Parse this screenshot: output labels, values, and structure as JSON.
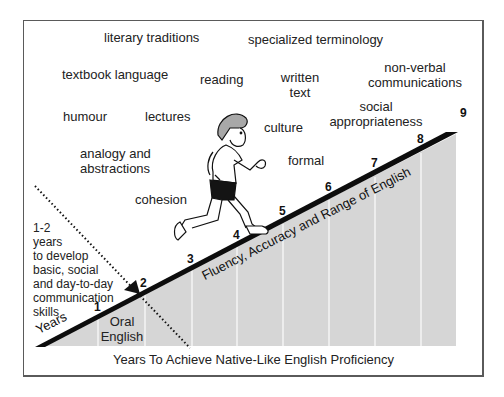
{
  "diagram": {
    "title": "Years To Achieve Native-Like English Proficiency",
    "slope_label": "Fluency, Accuracy and Range of English",
    "years_label": "Years",
    "oral_english_label": [
      "Oral",
      "English"
    ],
    "note": [
      "1-2",
      "years",
      "to develop",
      "basic, social",
      "and day-to-day",
      "communication",
      "skills"
    ],
    "year_markers": [
      "1",
      "2",
      "3",
      "4",
      "5",
      "6",
      "7",
      "8",
      "9"
    ],
    "concepts": {
      "literary_traditions": "literary traditions",
      "specialized_terminology": "specialized terminology",
      "textbook_language": "textbook language",
      "reading": "reading",
      "written_text": [
        "written",
        "text"
      ],
      "non_verbal": [
        "non-verbal",
        "communications"
      ],
      "humour": "humour",
      "lectures": "lectures",
      "culture": "culture",
      "social_appropriateness": [
        "social",
        "appropriateness"
      ],
      "analogy": [
        "analogy and",
        "abstractions"
      ],
      "formal": "formal",
      "cohesion": "cohesion"
    },
    "colors": {
      "band": "#0d0d0d",
      "gray_fill": "#d6d6d6",
      "column_divider": "#f4f4f4",
      "frame": "#5a5a5a"
    }
  }
}
